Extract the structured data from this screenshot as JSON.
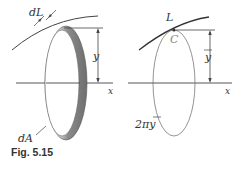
{
  "figure": {
    "caption": "Fig. 5.15",
    "left_panel": {
      "labels": {
        "dL": "dL",
        "y": "y",
        "x": "x",
        "dA": "dA"
      }
    },
    "right_panel": {
      "labels": {
        "L": "L",
        "C": "C",
        "y_bar": "y",
        "x": "x",
        "circumference": "2πy"
      }
    },
    "colors": {
      "ring_dark": "#777777",
      "ring_light": "#d8d8d8",
      "line": "#444444"
    }
  }
}
